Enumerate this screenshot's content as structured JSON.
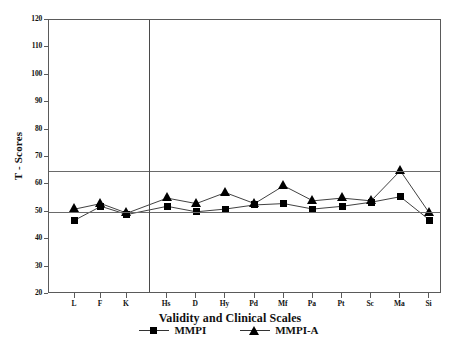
{
  "chart_data": {
    "type": "line",
    "title": "",
    "xlabel": "Validity and Clinical Scales",
    "ylabel": "T - Scores",
    "categories": [
      "L",
      "F",
      "K",
      "Hs",
      "D",
      "Hy",
      "Pd",
      "Mf",
      "Pa",
      "Pt",
      "Sc",
      "Ma",
      "Si"
    ],
    "series": [
      {
        "name": "MMPI",
        "marker": "square",
        "values": [
          47,
          52,
          49,
          52,
          50,
          51,
          52.5,
          53,
          51,
          52,
          53.5,
          55.5,
          47
        ]
      },
      {
        "name": "MMPI-A",
        "marker": "triangle",
        "values": [
          51,
          53,
          49.5,
          55,
          53,
          57,
          53,
          59.5,
          54,
          55,
          54,
          65,
          49.5
        ]
      }
    ],
    "ylim": [
      20,
      120
    ],
    "yticks": [
      20,
      30,
      40,
      50,
      60,
      70,
      80,
      90,
      100,
      110,
      120
    ],
    "reference_lines": [
      50,
      65
    ],
    "group_separator_after": "K",
    "grid": false,
    "legend_position": "bottom"
  },
  "legend": {
    "entries": [
      {
        "label": "MMPI"
      },
      {
        "label": "MMPI-A"
      }
    ]
  },
  "axis": {
    "y_title": "T - Scores",
    "x_title": "Validity and Clinical Scales"
  },
  "artifact": {
    "corner_text": ""
  }
}
